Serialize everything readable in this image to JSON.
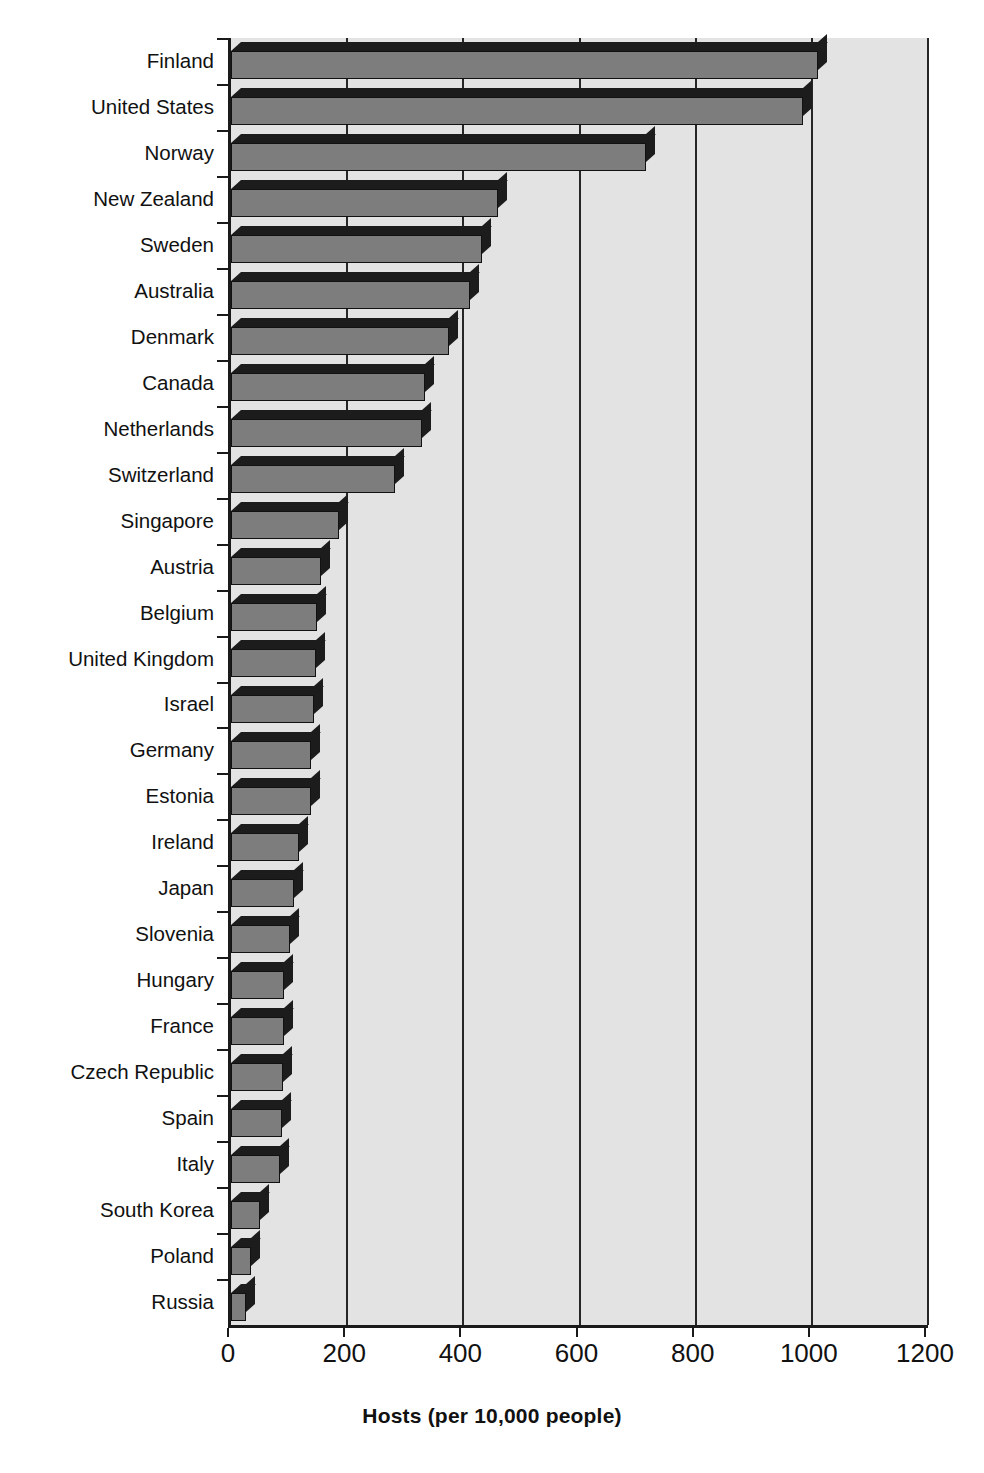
{
  "chart_data": {
    "type": "bar",
    "orientation": "horizontal",
    "title": "",
    "xlabel": "Hosts (per 10,000 people)",
    "ylabel": "",
    "xlim": [
      0,
      1200
    ],
    "xticks": [
      0,
      200,
      400,
      600,
      800,
      1000,
      1200
    ],
    "xtick_labels": [
      "0",
      "200",
      "400",
      "600",
      "800",
      "1000",
      "1200"
    ],
    "grid": true,
    "grid_axis": "x",
    "legend": false,
    "categories": [
      "Finland",
      "United States",
      "Norway",
      "New Zealand",
      "Sweden",
      "Australia",
      "Denmark",
      "Canada",
      "Netherlands",
      "Switzerland",
      "Singapore",
      "Austria",
      "Belgium",
      "United Kingdom",
      "Israel",
      "Germany",
      "Estonia",
      "Ireland",
      "Japan",
      "Slovenia",
      "Hungary",
      "France",
      "Czech Republic",
      "Spain",
      "Italy",
      "South Korea",
      "Poland",
      "Russia"
    ],
    "values": [
      1010,
      985,
      715,
      460,
      432,
      412,
      376,
      334,
      328,
      282,
      186,
      155,
      148,
      146,
      143,
      138,
      137,
      117,
      108,
      101,
      92,
      91,
      89,
      88,
      85,
      50,
      34,
      25
    ],
    "colors": {
      "bar_face": "#7d7d7d",
      "bar_shade": "#1c1c1c",
      "plot_background": "#e3e3e3",
      "gridline": "#262626",
      "axis": "#1a1a1a",
      "text": "#111111",
      "page_background": "#ffffff"
    }
  }
}
